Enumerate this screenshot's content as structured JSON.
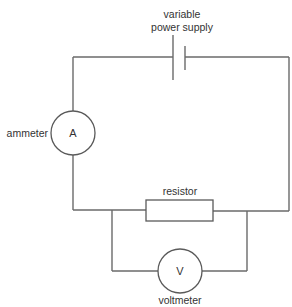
{
  "diagram": {
    "type": "circuit",
    "colors": {
      "wire": "#6a6a6a",
      "text": "#333333",
      "background": "#ffffff"
    },
    "components": {
      "power_supply": {
        "label_line1": "variable",
        "label_line2": "power supply"
      },
      "ammeter": {
        "label": "ammeter",
        "symbol": "A"
      },
      "resistor": {
        "label": "resistor"
      },
      "voltmeter": {
        "label": "voltmeter",
        "symbol": "V"
      }
    }
  }
}
